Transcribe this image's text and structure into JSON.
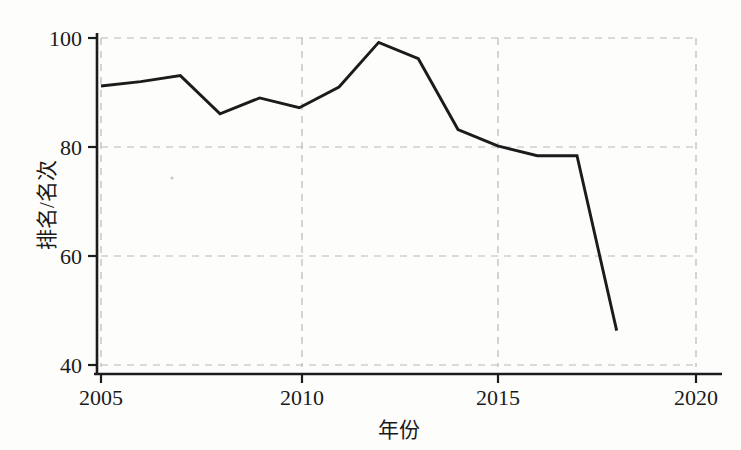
{
  "chart_data": {
    "type": "line",
    "title": "",
    "subtitle": "",
    "xlabel": "年份",
    "ylabel": "排名/名次",
    "x": [
      2005,
      2006,
      2007,
      2008,
      2009,
      2010,
      2011,
      2012,
      2013,
      2014,
      2015,
      2016,
      2017,
      2018
    ],
    "values": [
      91.2,
      92.0,
      93.1,
      86.1,
      89.0,
      87.2,
      91.0,
      99.2,
      96.2,
      83.2,
      80.2,
      78.4,
      78.4,
      46.3
    ],
    "series": [
      {
        "name": "排名",
        "values": [
          91.2,
          92.0,
          93.1,
          86.1,
          89.0,
          87.2,
          91.0,
          99.2,
          96.2,
          83.2,
          80.2,
          78.4,
          78.4,
          46.3
        ],
        "color": "#1b1b1b"
      }
    ],
    "xlim": [
      2005,
      2020
    ],
    "ylim": [
      40,
      100
    ],
    "xticks": [
      2005,
      2010,
      2015,
      2020
    ],
    "xtick_labels": [
      "2005",
      "2010",
      "2015",
      "2020"
    ],
    "yticks": [
      40,
      60,
      80,
      100
    ],
    "ytick_labels": [
      "40",
      "60",
      "80",
      "100"
    ],
    "grid": true,
    "grid_style": "dashed",
    "grid_color": "#b9b9b9",
    "legend": false,
    "legend_position": "none",
    "markers": false,
    "line_color": "#1b1b1b",
    "background_color": "#fdfdfc",
    "axis_color": "#1c1c1c"
  },
  "labels": {
    "x_tick_0": "2005",
    "x_tick_1": "2010",
    "x_tick_2": "2015",
    "x_tick_3": "2020",
    "y_tick_0": "40",
    "y_tick_1": "60",
    "y_tick_2": "80",
    "y_tick_3": "100",
    "x_axis_title": "年份",
    "y_axis_title": "排名/名次"
  }
}
